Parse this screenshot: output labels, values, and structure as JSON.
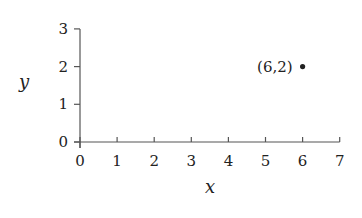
{
  "chart_data": {
    "type": "scatter",
    "title": "",
    "xlabel": "x",
    "ylabel": "y",
    "xlim": [
      0,
      7
    ],
    "ylim": [
      0,
      3
    ],
    "xticks": [
      0,
      1,
      2,
      3,
      4,
      5,
      6,
      7
    ],
    "yticks": [
      0,
      1,
      2,
      3
    ],
    "grid": false,
    "legend": null,
    "points": [
      {
        "x": 6,
        "y": 2,
        "label": "(6,2)"
      }
    ]
  },
  "colors": {
    "axis": "#555555",
    "text": "#222222",
    "point": "#222222"
  },
  "plot_px": {
    "x0": 80,
    "x_per_unit": 37.1,
    "y0": 142,
    "y_per_unit": 37.7
  }
}
